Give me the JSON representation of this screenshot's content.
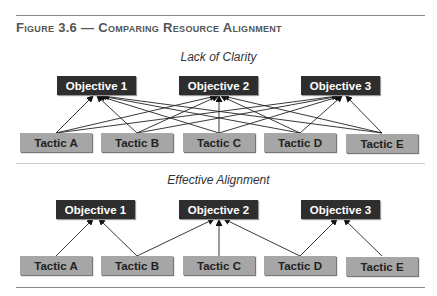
{
  "figure": {
    "title": "Figure 3.6 — Comparing Resource Alignment"
  },
  "diagrams": [
    {
      "subtitle": "Lack of Clarity",
      "objectives": [
        "Objective 1",
        "Objective 2",
        "Objective 3"
      ],
      "tactics": [
        "Tactic A",
        "Tactic B",
        "Tactic C",
        "Tactic D",
        "Tactic E"
      ],
      "links": "all tactics linked to all objectives"
    },
    {
      "subtitle": "Effective Alignment",
      "objectives": [
        "Objective 1",
        "Objective 2",
        "Objective 3"
      ],
      "tactics": [
        "Tactic A",
        "Tactic B",
        "Tactic C",
        "Tactic D",
        "Tactic E"
      ],
      "links": [
        [
          "Tactic A",
          "Objective 1"
        ],
        [
          "Tactic B",
          "Objective 1"
        ],
        [
          "Tactic B",
          "Objective 2"
        ],
        [
          "Tactic C",
          "Objective 2"
        ],
        [
          "Tactic D",
          "Objective 2"
        ],
        [
          "Tactic D",
          "Objective 3"
        ],
        [
          "Tactic E",
          "Objective 3"
        ]
      ]
    }
  ],
  "colors": {
    "objective_bg": "#2e2e2e",
    "tactic_bg": "#a6a6a6",
    "rule": "#8a8a8a"
  }
}
